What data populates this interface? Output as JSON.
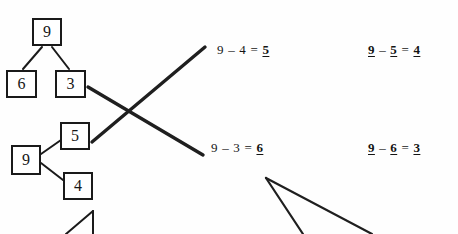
{
  "page": {
    "background_color": "#fefefe",
    "ink_color": "#1a1a1a",
    "width": 458,
    "height": 234
  },
  "number_bonds": [
    {
      "name": "number-bond-top-left",
      "orientation": "vertical",
      "whole": "9",
      "parts": [
        "6",
        "3"
      ]
    },
    {
      "name": "number-bond-lower-left",
      "orientation": "horizontal",
      "whole": "9",
      "parts": [
        "5",
        "4"
      ]
    }
  ],
  "equations": [
    {
      "name": "equation-nine-minus-four",
      "left": "9",
      "operator": "–",
      "right": "4",
      "equals": "=",
      "answer": "5",
      "answer_underlined": true,
      "operands_underlined": false
    },
    {
      "name": "equation-nine-minus-three",
      "left": "9",
      "operator": "–",
      "right": "3",
      "equals": "=",
      "answer": "6",
      "answer_underlined": true,
      "operands_underlined": false
    },
    {
      "name": "equation-nine-minus-five",
      "left": "9",
      "operator": "–",
      "right": "5",
      "equals": "=",
      "answer": "4",
      "answer_underlined": true,
      "operands_underlined": true
    },
    {
      "name": "equation-nine-minus-six",
      "left": "9",
      "operator": "–",
      "right": "6",
      "equals": "=",
      "answer": "3",
      "answer_underlined": true,
      "operands_underlined": true
    }
  ],
  "matching_strokes": {
    "name": "matching-lines",
    "description": "two thick crossing match lines forming an X between the number bonds and the equations",
    "count": 2
  },
  "partial_marks": {
    "bottom_left": "partial number bond cropped at page edge",
    "bottom_right": "partial matching lines cropped at page edge"
  }
}
